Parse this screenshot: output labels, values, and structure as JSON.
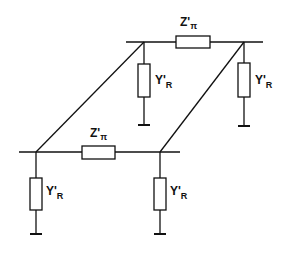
{
  "diagram": {
    "colors": {
      "line": "#111111",
      "background": "#ffffff"
    },
    "top_section": {
      "series_label": {
        "main": "Z'",
        "sub": "π"
      },
      "left_shunt_label": {
        "main": "Y'",
        "sub": "R"
      },
      "right_shunt_label": {
        "main": "Y'",
        "sub": "R"
      }
    },
    "bottom_section": {
      "series_label": {
        "main": "Z'",
        "sub": "π"
      },
      "left_shunt_label": {
        "main": "Y'",
        "sub": "R"
      },
      "right_shunt_label": {
        "main": "Y'",
        "sub": "R"
      }
    }
  }
}
